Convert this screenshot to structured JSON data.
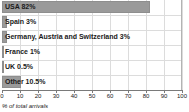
{
  "chart_data": {
    "type": "bar",
    "orientation": "horizontal",
    "title": "",
    "xlabel": "% of total arrivals",
    "ylabel": "",
    "xlim": [
      0,
      100
    ],
    "xticks": [
      0,
      10,
      20,
      30,
      40,
      50,
      60,
      70,
      80,
      90,
      100
    ],
    "grid": true,
    "legend": false,
    "categories": [
      "USA",
      "Spain",
      "Germany, Austria and Switzerland",
      "France",
      "UK",
      "Other"
    ],
    "values": [
      82,
      3,
      3,
      1,
      0.5,
      10.5
    ],
    "bar_labels": [
      "USA 82%",
      "Spain 3%",
      "Germany, Austria and Switzerland 3%",
      "France 1%",
      "UK 0.5%",
      "Other 10.5%"
    ]
  },
  "colors": {
    "bar_fill": "#9a9a9a",
    "bar_stroke": "#8e8e8e",
    "gridline": "#dcdcdc",
    "axis": "#7a7a7a",
    "text": "#1a1a1a",
    "background": "#ffffff"
  }
}
